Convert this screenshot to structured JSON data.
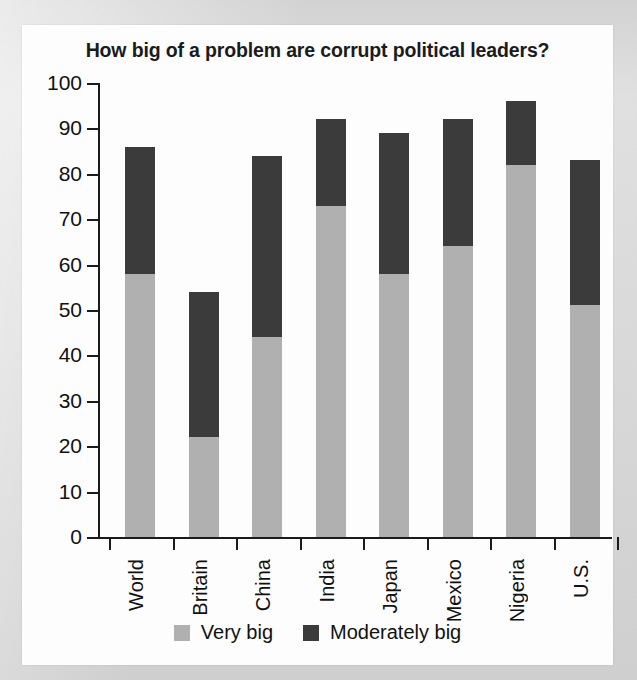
{
  "chart_data": {
    "type": "bar",
    "title": "How big of a problem are corrupt political leaders?",
    "xlabel": "",
    "ylabel": "",
    "ylim": [
      0,
      100
    ],
    "ytick_step": 10,
    "yticks": [
      "0",
      "10",
      "20",
      "30",
      "40",
      "50",
      "60",
      "70",
      "80",
      "90",
      "100"
    ],
    "grid": false,
    "stacked": true,
    "legend_position": "bottom-center",
    "categories": [
      "World",
      "Britain",
      "China",
      "India",
      "Japan",
      "Mexico",
      "Nigeria",
      "U.S."
    ],
    "series": [
      {
        "name": "Very big",
        "color": "#b0b0b0",
        "values": [
          58,
          22,
          44,
          73,
          58,
          64,
          82,
          51
        ]
      },
      {
        "name": "Moderately big",
        "color": "#3b3b3b",
        "values": [
          28,
          32,
          40,
          19,
          31,
          28,
          14,
          32
        ]
      }
    ],
    "totals": [
      86,
      54,
      84,
      92,
      89,
      92,
      96,
      83
    ]
  },
  "legend": {
    "items": [
      {
        "label": "Very big",
        "swatch": "light-gray-swatch-icon"
      },
      {
        "label": "Moderately big",
        "swatch": "dark-gray-swatch-icon"
      }
    ]
  },
  "colors": {
    "page_background": "#dcdcdc",
    "panel_background": "#fdfdfd",
    "axis": "#1b1b1b",
    "text": "#111111",
    "very_big": "#b0b0b0",
    "moderately_big": "#3b3b3b"
  }
}
